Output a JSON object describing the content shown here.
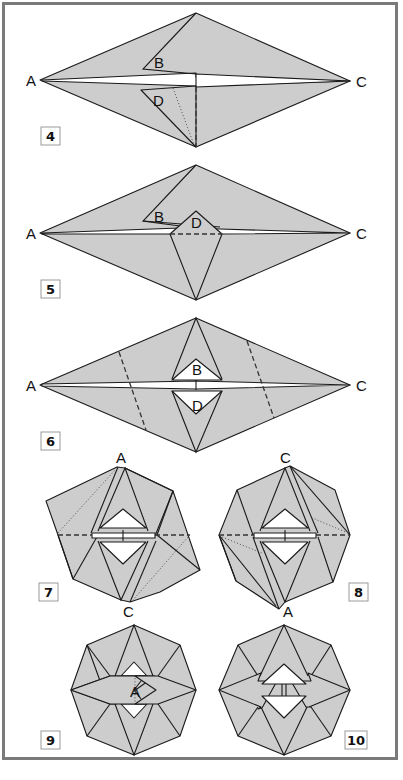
{
  "frame": {
    "border_color": "#7a7a7a",
    "paper_color": "#cdcdcd",
    "line_color": "#1a1a1a"
  },
  "steps": [
    {
      "number": "4",
      "labels": {
        "a": "A",
        "b": "B",
        "c": "C",
        "d": "D"
      }
    },
    {
      "number": "5",
      "labels": {
        "a": "A",
        "b": "B",
        "c": "C",
        "d": "D"
      }
    },
    {
      "number": "6",
      "labels": {
        "a": "A",
        "b": "B",
        "c": "C",
        "d": "D"
      }
    },
    {
      "number": "7",
      "labels": {
        "top": "A",
        "bottom": "C"
      }
    },
    {
      "number": "8",
      "labels": {
        "top": "C",
        "bottom": "A"
      }
    },
    {
      "number": "9",
      "labels": {
        "center": "A"
      }
    },
    {
      "number": "10",
      "labels": {}
    }
  ]
}
